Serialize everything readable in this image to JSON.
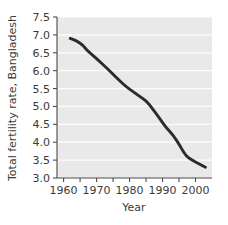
{
  "chart_data": {
    "type": "line",
    "title": "",
    "xlabel": "Year",
    "ylabel": "Total fertility rate, Bangladesh",
    "xlim": [
      1958,
      2005
    ],
    "ylim": [
      3.0,
      7.5
    ],
    "grid": "horizontal-white-gridlines",
    "legend": "none",
    "x_ticks_major": [
      1960,
      1970,
      1980,
      1990,
      2000
    ],
    "x_ticks_minor": [
      1965,
      1975,
      1985,
      1995
    ],
    "x_tick_labels": [
      "1960",
      "1970",
      "1980",
      "1990",
      "2000"
    ],
    "y_ticks": [
      3.0,
      3.5,
      4.0,
      4.5,
      5.0,
      5.5,
      6.0,
      6.5,
      7.0,
      7.5
    ],
    "y_tick_labels": [
      "3.0",
      "3.5",
      "4.0",
      "4.5",
      "5.0",
      "5.5",
      "6.0",
      "6.5",
      "7.0",
      "7.5"
    ],
    "series": [
      {
        "name": "Total fertility rate, Bangladesh",
        "color": "#2b2b2b",
        "x": [
          1962,
          1964,
          1966,
          1967,
          1969,
          1971,
          1973,
          1975,
          1977,
          1979,
          1981,
          1983,
          1985,
          1987,
          1989,
          1991,
          1993,
          1995,
          1997,
          1999,
          2001,
          2003
        ],
        "values": [
          6.9,
          6.83,
          6.7,
          6.58,
          6.42,
          6.25,
          6.08,
          5.9,
          5.72,
          5.55,
          5.42,
          5.28,
          5.17,
          4.93,
          4.68,
          4.42,
          4.22,
          3.95,
          3.62,
          3.5,
          3.4,
          3.3
        ]
      }
    ]
  },
  "axes": {
    "y_title": "Total fertility rate, Bangladesh",
    "x_title": "Year"
  },
  "colors": {
    "plot_background": "#e9e9e9",
    "gridline": "#fdfdfd",
    "line": "#2b2b2b",
    "axis": "#4a4a4a",
    "text": "#3a3a3a"
  }
}
